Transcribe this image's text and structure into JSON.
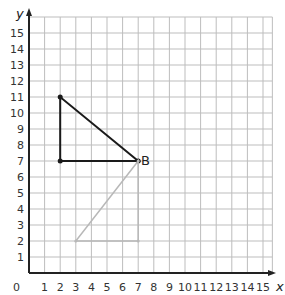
{
  "chart_data": {
    "type": "scatter",
    "title": "",
    "xlabel": "x",
    "ylabel": "y",
    "xlim": [
      0,
      15
    ],
    "ylim": [
      0,
      15
    ],
    "grid": true,
    "x_ticks": [
      "0",
      "1",
      "2",
      "3",
      "4",
      "5",
      "6",
      "7",
      "8",
      "9",
      "10",
      "11",
      "12",
      "13",
      "14",
      "15"
    ],
    "y_ticks": [
      "1",
      "2",
      "3",
      "4",
      "5",
      "6",
      "7",
      "8",
      "9",
      "10",
      "11",
      "12",
      "13",
      "14",
      "15"
    ],
    "shapes": [
      {
        "name": "dark-triangle",
        "color": "#1a1a1a",
        "vertices": [
          [
            2,
            11
          ],
          [
            2,
            7
          ],
          [
            7,
            7
          ]
        ]
      },
      {
        "name": "light-triangle",
        "color": "#b8b8b8",
        "vertices": [
          [
            3,
            2
          ],
          [
            7,
            2
          ],
          [
            7,
            7
          ]
        ]
      }
    ],
    "points": [
      {
        "x": 2,
        "y": 11,
        "label": ""
      },
      {
        "x": 2,
        "y": 7,
        "label": ""
      },
      {
        "x": 7,
        "y": 7,
        "label": "B"
      },
      {
        "x": 3,
        "y": 2,
        "label": ""
      },
      {
        "x": 7,
        "y": 2,
        "label": ""
      }
    ]
  },
  "labels": {
    "x_axis": "x",
    "y_axis": "y",
    "origin": "0",
    "point_b": "B"
  },
  "colors": {
    "grid": "#bdbdbd",
    "axis": "#222222",
    "dark_shape": "#1a1a1a",
    "light_shape": "#b8b8b8"
  }
}
